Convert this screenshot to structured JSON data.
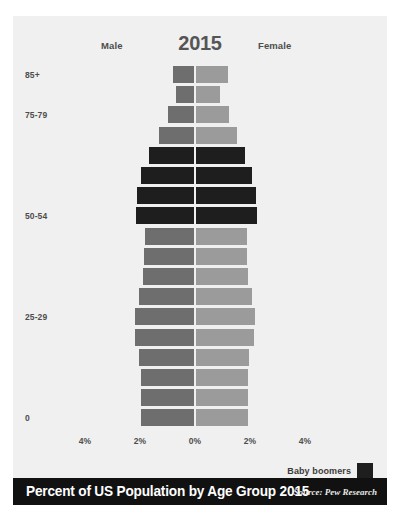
{
  "header": {
    "male_label": "Male",
    "female_label": "Female",
    "year": "2015"
  },
  "legend": {
    "label": "Baby boomers",
    "swatch_color": "#1e1e1e"
  },
  "footer": {
    "title": "Percent of US Population by Age Group 2015",
    "source": "Source: Pew Research"
  },
  "colors": {
    "male": "#6e6e6e",
    "female": "#9b9b9b",
    "boomer": "#1e1e1e",
    "background": "#f0f0f0",
    "footer_bar": "#111111",
    "text": "#4d4d4d"
  },
  "chart_data": {
    "type": "bar",
    "subtype": "population-pyramid",
    "title": "Percent of US Population by Age Group 2015",
    "xlabel": "",
    "ylabel": "",
    "xlim": [
      -4,
      4
    ],
    "xticks": [
      -4,
      -2,
      0,
      2,
      4
    ],
    "xtick_labels": [
      "4%",
      "2%",
      "0%",
      "2%",
      "4%"
    ],
    "grid": false,
    "legend_position": "bottom-right",
    "axis_ytick_labels": [
      "85+",
      "75-79",
      "50-54",
      "25-29",
      "0"
    ],
    "categories": [
      "85+",
      "80-84",
      "75-79",
      "70-74",
      "65-69",
      "60-64",
      "55-59",
      "50-54",
      "45-49",
      "40-44",
      "35-39",
      "30-34",
      "25-29",
      "20-24",
      "15-19",
      "10-14",
      "5-9",
      "0"
    ],
    "series": [
      {
        "name": "Male",
        "values": [
          0.75,
          0.63,
          0.95,
          1.28,
          1.63,
          1.9,
          2.05,
          2.1,
          1.78,
          1.8,
          1.83,
          2.0,
          2.13,
          2.15,
          2.0,
          1.93,
          1.93,
          1.93
        ]
      },
      {
        "name": "Female",
        "values": [
          1.15,
          0.88,
          1.18,
          1.48,
          1.78,
          2.03,
          2.17,
          2.2,
          1.83,
          1.83,
          1.88,
          2.02,
          2.12,
          2.1,
          1.92,
          1.88,
          1.88,
          1.88
        ]
      }
    ],
    "boomer_categories": [
      "65-69",
      "60-64",
      "55-59",
      "50-54"
    ]
  }
}
